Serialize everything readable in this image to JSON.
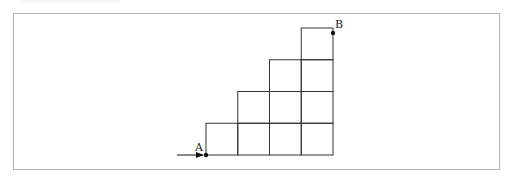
{
  "diagram": {
    "type": "staircase-grid",
    "colors": {
      "line": "#333333",
      "frame": "#b5b5b5",
      "dot": "#111111"
    },
    "grid": {
      "origin": [
        206,
        155
      ],
      "cell": 31.75,
      "columns": [
        {
          "index": 1,
          "height_cells": 1
        },
        {
          "index": 2,
          "height_cells": 2
        },
        {
          "index": 3,
          "height_cells": 3
        },
        {
          "index": 4,
          "height_cells": 4
        }
      ]
    },
    "points": [
      {
        "id": "A",
        "label": "A",
        "x": 206,
        "y": 155,
        "label_x": 195,
        "label_y": 151
      },
      {
        "id": "B",
        "label": "B",
        "x": 333,
        "y": 33,
        "label_x": 335,
        "label_y": 28
      }
    ],
    "arrow": {
      "from": [
        177,
        155
      ],
      "to": [
        203,
        155
      ],
      "target": "A"
    }
  }
}
